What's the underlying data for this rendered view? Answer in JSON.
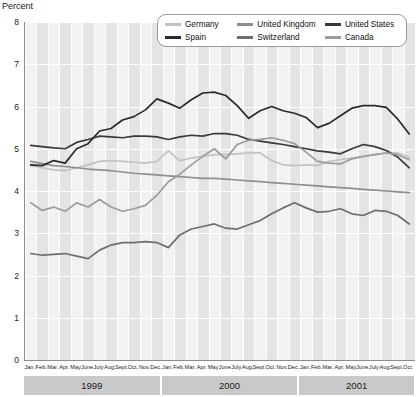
{
  "axis": {
    "y_title": "Percent",
    "y_ticks": [
      0,
      1,
      2,
      3,
      4,
      5,
      6,
      7,
      8
    ],
    "y_min": 0,
    "y_max": 8
  },
  "legend": {
    "rows": [
      [
        {
          "label": "Germany",
          "color": "#c2c2c2"
        },
        {
          "label": "United Kingdom",
          "color": "#8f8f8f"
        },
        {
          "label": "United States",
          "color": "#3a3a3a"
        }
      ],
      [
        {
          "label": "Spain",
          "color": "#2b2b2b"
        },
        {
          "label": "Switzerland",
          "color": "#6e6e6e"
        },
        {
          "label": "Canada",
          "color": "#9c9c9c"
        }
      ]
    ]
  },
  "years": [
    {
      "label": "1999",
      "months": 12
    },
    {
      "label": "2000",
      "months": 12
    },
    {
      "label": "2001",
      "months": 10
    }
  ],
  "chart_data": {
    "type": "line",
    "title": "",
    "xlabel": "",
    "ylabel": "Percent",
    "ylim": [
      0,
      8
    ],
    "grid": true,
    "legend_position": "top-right",
    "x": [
      "Jan. 1999",
      "Feb. 1999",
      "Mar. 1999",
      "Apr. 1999",
      "May 1999",
      "June 1999",
      "July 1999",
      "Aug. 1999",
      "Sept. 1999",
      "Oct. 1999",
      "Nov. 1999",
      "Dec. 1999",
      "Jan. 2000",
      "Feb. 2000",
      "Mar. 2000",
      "Apr. 2000",
      "May 2000",
      "June 2000",
      "July 2000",
      "Aug. 2000",
      "Sept. 2000",
      "Oct. 2000",
      "Nov. 2000",
      "Dec. 2000",
      "Jan. 2001",
      "Feb. 2001",
      "Mar. 2001",
      "Apr. 2001",
      "May 2001",
      "June 2001",
      "July 2001",
      "Aug. 2001",
      "Sept. 2001",
      "Oct. 2001"
    ],
    "x_tick_labels": [
      "Jan.",
      "Feb.",
      "Mar.",
      "Apr.",
      "May",
      "June",
      "July",
      "Aug.",
      "Sept.",
      "Oct.",
      "Nov.",
      "Dec.",
      "Jan.",
      "Feb.",
      "Mar.",
      "Apr.",
      "May",
      "June",
      "July",
      "Aug.",
      "Sept.",
      "Oct.",
      "Nov.",
      "Dec.",
      "Jan.",
      "Feb.",
      "Mar.",
      "Apr.",
      "May",
      "June",
      "July",
      "Aug.",
      "Sept.",
      "Oct."
    ],
    "series": [
      {
        "name": "Germany",
        "color": "#c2c2c2",
        "values": [
          4.6,
          4.55,
          4.5,
          4.48,
          4.55,
          4.62,
          4.7,
          4.72,
          4.7,
          4.68,
          4.66,
          4.7,
          4.95,
          4.72,
          4.78,
          4.82,
          4.86,
          4.86,
          4.88,
          4.9,
          4.9,
          4.72,
          4.62,
          4.6,
          4.62,
          4.6,
          4.7,
          4.74,
          4.78,
          4.82,
          4.86,
          4.9,
          4.9,
          4.8
        ]
      },
      {
        "name": "United Kingdom",
        "color": "#8f8f8f",
        "values": [
          4.7,
          4.65,
          4.6,
          4.58,
          4.55,
          4.52,
          4.5,
          4.48,
          4.45,
          4.42,
          4.4,
          4.38,
          4.36,
          4.34,
          4.32,
          4.3,
          4.3,
          4.28,
          4.26,
          4.24,
          4.22,
          4.2,
          4.18,
          4.16,
          4.14,
          4.12,
          4.1,
          4.08,
          4.06,
          4.04,
          4.02,
          4.0,
          3.98,
          3.96
        ]
      },
      {
        "name": "United States",
        "color": "#3a3a3a",
        "values": [
          5.08,
          5.05,
          5.02,
          5.0,
          5.15,
          5.22,
          5.3,
          5.28,
          5.26,
          5.3,
          5.3,
          5.28,
          5.22,
          5.28,
          5.32,
          5.3,
          5.36,
          5.36,
          5.32,
          5.22,
          5.18,
          5.14,
          5.1,
          5.05,
          5.0,
          4.95,
          4.92,
          4.88,
          5.0,
          5.1,
          5.05,
          4.96,
          4.8,
          4.55
        ]
      },
      {
        "name": "Spain",
        "color": "#2b2b2b",
        "values": [
          4.62,
          4.6,
          4.72,
          4.66,
          5.0,
          5.12,
          5.42,
          5.48,
          5.68,
          5.76,
          5.92,
          6.18,
          6.08,
          5.96,
          6.16,
          6.32,
          6.34,
          6.26,
          6.02,
          5.72,
          5.9,
          6.0,
          5.9,
          5.84,
          5.74,
          5.5,
          5.6,
          5.78,
          5.96,
          6.02,
          6.02,
          5.98,
          5.7,
          5.35
        ]
      },
      {
        "name": "Switzerland",
        "color": "#6e6e6e",
        "values": [
          2.52,
          2.48,
          2.5,
          2.52,
          2.46,
          2.4,
          2.6,
          2.72,
          2.78,
          2.78,
          2.8,
          2.78,
          2.66,
          2.96,
          3.1,
          3.16,
          3.22,
          3.12,
          3.1,
          3.2,
          3.3,
          3.46,
          3.6,
          3.72,
          3.6,
          3.5,
          3.52,
          3.58,
          3.46,
          3.42,
          3.54,
          3.52,
          3.42,
          3.22
        ]
      },
      {
        "name": "Canada",
        "color": "#9c9c9c",
        "values": [
          3.72,
          3.54,
          3.62,
          3.52,
          3.72,
          3.62,
          3.8,
          3.62,
          3.52,
          3.58,
          3.66,
          3.9,
          4.22,
          4.4,
          4.62,
          4.82,
          5.0,
          4.76,
          5.1,
          5.2,
          5.22,
          5.26,
          5.2,
          5.12,
          4.92,
          4.7,
          4.66,
          4.64,
          4.76,
          4.82,
          4.86,
          4.9,
          4.86,
          4.74
        ]
      }
    ]
  }
}
